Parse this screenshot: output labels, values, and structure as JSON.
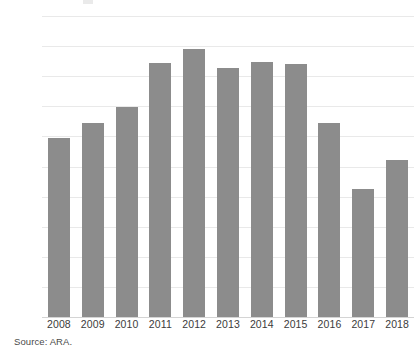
{
  "chart_data": {
    "type": "bar",
    "title": "",
    "subtitle": "",
    "xlabel": "",
    "ylabel": "",
    "categories": [
      "2008",
      "2009",
      "2010",
      "2011",
      "2012",
      "2013",
      "2014",
      "2015",
      "2016",
      "2017",
      "2018"
    ],
    "values": [
      297,
      322,
      349,
      422,
      445,
      413,
      424,
      421,
      322,
      213,
      261
    ],
    "series": [
      {
        "name": "",
        "values": [
          297,
          322,
          349,
          422,
          445,
          413,
          424,
          421,
          322,
          213,
          261
        ]
      }
    ],
    "ylim": [
      0,
      500
    ],
    "ytick_step": 50,
    "ytick_labels": [
      "0",
      "50",
      "100",
      "150",
      "200",
      "250",
      "300",
      "350",
      "400",
      "450",
      "500"
    ],
    "ytick_values": [
      0,
      50,
      100,
      150,
      200,
      250,
      300,
      350,
      400,
      450,
      500
    ],
    "grid": true,
    "grid_axis": "y",
    "legend": false,
    "legend_position": "none",
    "bar_color": "#8c8c8c",
    "gridline_color": "#e9e9e9",
    "axis_color": "#d4d4d4",
    "text_color": "#3b3b3b",
    "background_color": "#ffffff"
  },
  "footer": {
    "source_note": "Source: ARA."
  }
}
